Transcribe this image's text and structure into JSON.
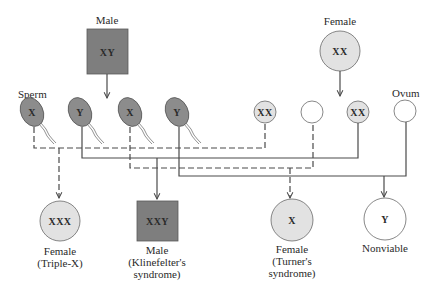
{
  "diagram": {
    "colors": {
      "male_fill": "#7e7e7e",
      "female_fill": "#e2e2e2",
      "sperm_fill": "#8c8c8c",
      "empty_fill": "#ffffff",
      "line": "#4a4a4a"
    },
    "parents": {
      "male": {
        "label": "Male",
        "genotype": "XY",
        "shape": "square"
      },
      "female": {
        "label": "Female",
        "genotype": "XX",
        "shape": "circle"
      }
    },
    "gametes": {
      "sperm_label": "Sperm",
      "ovum_label": "Ovum",
      "sperm": [
        {
          "chromosome": "X",
          "line": "dashed"
        },
        {
          "chromosome": "Y",
          "line": "solid"
        },
        {
          "chromosome": "X",
          "line": "dashed"
        },
        {
          "chromosome": "Y",
          "line": "solid"
        }
      ],
      "ova": [
        {
          "chromosome": "XX",
          "line": "dashed"
        },
        {
          "chromosome": "",
          "line": "dashed"
        },
        {
          "chromosome": "XX",
          "line": "solid"
        },
        {
          "chromosome": "",
          "line": "solid"
        }
      ]
    },
    "offspring": [
      {
        "genotype": "XXX",
        "shape": "circle",
        "label_line1": "Female",
        "label_line2": "(Triple-X)",
        "label_line3": ""
      },
      {
        "genotype": "XXY",
        "shape": "square",
        "label_line1": "Male",
        "label_line2": "(Klinefelter's",
        "label_line3": "syndrome)"
      },
      {
        "genotype": "X",
        "shape": "circle",
        "label_line1": "Female",
        "label_line2": "(Turner's",
        "label_line3": "syndrome)"
      },
      {
        "genotype": "Y",
        "shape": "circle",
        "label_line1": "Nonviable",
        "label_line2": "",
        "label_line3": ""
      }
    ],
    "edges": [
      {
        "from": "sperm-1",
        "to": "ovum-1",
        "offspring": "XXX",
        "style": "dashed"
      },
      {
        "from": "sperm-2",
        "to": "ovum-3",
        "offspring": "XXY",
        "style": "solid"
      },
      {
        "from": "sperm-3",
        "to": "ovum-2",
        "offspring": "X",
        "style": "dashed"
      },
      {
        "from": "sperm-4",
        "to": "ovum-4",
        "offspring": "Y",
        "style": "solid"
      }
    ]
  }
}
